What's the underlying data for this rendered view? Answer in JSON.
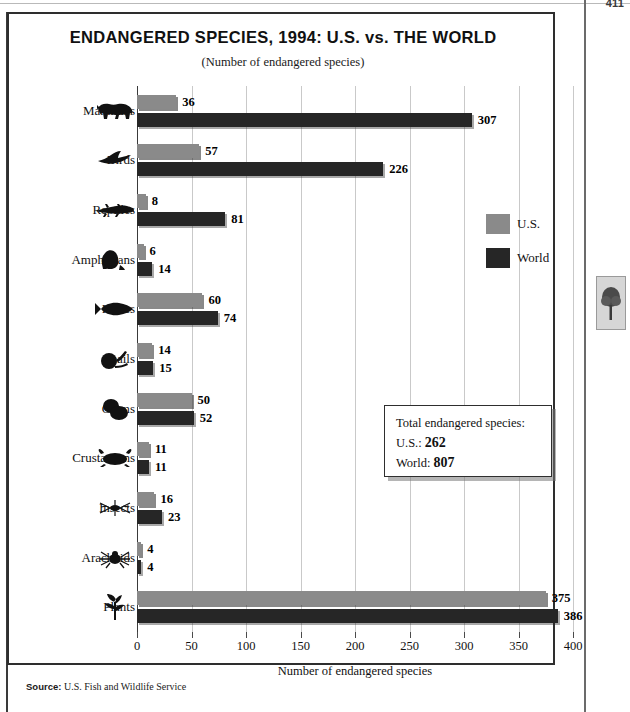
{
  "page": {
    "page_number": "411",
    "source_prefix": "Source:",
    "source_text": "U.S. Fish and Wildlife Service",
    "thumbnail_icon": "tree-icon"
  },
  "legend": {
    "position": "right-inside",
    "items": [
      {
        "label": "U.S.",
        "color": "#8a8a8a",
        "key": "us"
      },
      {
        "label": "World",
        "color": "#262626",
        "key": "world"
      }
    ]
  },
  "total_box": {
    "heading": "Total endangered species:",
    "us_label": "U.S.:",
    "us_value": "262",
    "world_label": "World:",
    "world_value": "807"
  },
  "icons": [
    "cow-icon",
    "bird-icon",
    "lizard-icon",
    "frog-icon",
    "fish-icon",
    "snail-icon",
    "clam-icon",
    "crab-icon",
    "insect-icon",
    "spider-icon",
    "plant-icon"
  ],
  "chart_data": {
    "type": "bar",
    "orientation": "horizontal",
    "title": "ENDANGERED SPECIES, 1994: U.S. vs. THE WORLD",
    "subtitle": "(Number of endangered species)",
    "xlabel": "Number of endangered species",
    "ylabel": "",
    "xlim": [
      0,
      400
    ],
    "xticks": [
      0,
      50,
      100,
      150,
      200,
      250,
      300,
      350,
      400
    ],
    "xticklabels": [
      "0",
      "50",
      "100",
      "150",
      "200",
      "250",
      "300",
      "350",
      "400"
    ],
    "grid": true,
    "legend_position": "right-inside",
    "categories": [
      "Mammals",
      "Birds",
      "Reptiles",
      "Amphibians",
      "Fishes",
      "Snails",
      "Clams",
      "Crustaceans",
      "Insects",
      "Arachnids",
      "Plants"
    ],
    "series": [
      {
        "name": "U.S.",
        "color": "#8a8a8a",
        "values": [
          36,
          57,
          8,
          6,
          60,
          14,
          50,
          11,
          16,
          4,
          375
        ]
      },
      {
        "name": "World",
        "color": "#262626",
        "values": [
          307,
          226,
          81,
          14,
          74,
          15,
          52,
          11,
          23,
          4,
          386
        ]
      }
    ],
    "totals": {
      "U.S.": 262,
      "World": 807
    }
  }
}
